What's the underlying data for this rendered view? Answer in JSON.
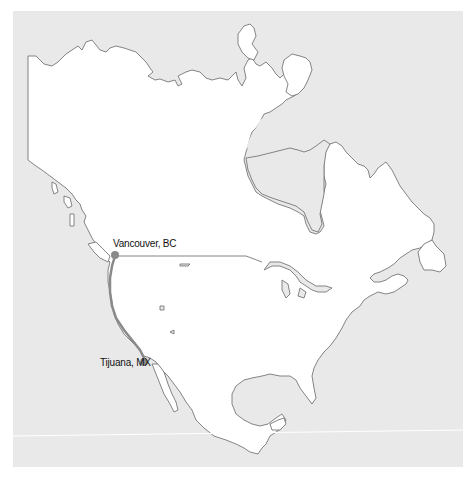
{
  "map": {
    "title": "",
    "region": "North America",
    "colors": {
      "background": "#e9e9e9",
      "land": "#ffffff",
      "outline": "#777777",
      "route": "#8a8a8a",
      "marker": "#8a8a8a"
    },
    "markers": [
      {
        "label": "Vancouver, BC",
        "x": 115,
        "y": 255
      },
      {
        "label": "Tijuana, MX",
        "x": 144,
        "y": 362
      }
    ],
    "route": {
      "from": "Vancouver, BC",
      "to": "Tijuana, MX"
    }
  }
}
